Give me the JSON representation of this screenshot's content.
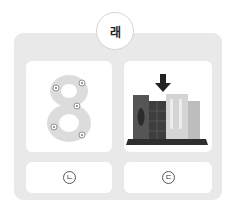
{
  "question": {
    "badge_label": "래"
  },
  "images": {
    "left": {
      "icon": "number-eight-with-flowers-icon",
      "depicts": "8"
    },
    "right": {
      "icon": "books-on-shelf-with-arrow-icon"
    }
  },
  "options": [
    {
      "label": "ㄴ",
      "marker": "circled"
    },
    {
      "label": "ㄷ",
      "marker": "circled"
    }
  ],
  "colors": {
    "panel_bg": "#e9e9e9",
    "card_bg": "#ffffff",
    "eight_fill": "#dcdcdc",
    "book_dark": "#4a4a4a",
    "book_light": "#cfcfcf",
    "arrow": "#222222"
  }
}
